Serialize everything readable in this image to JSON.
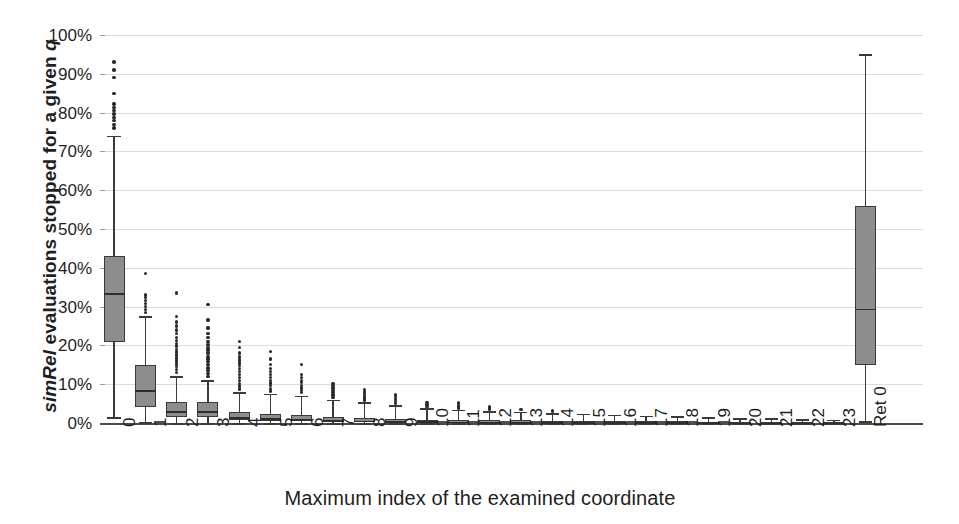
{
  "chart_data": {
    "type": "boxplot",
    "title": "",
    "xlabel": "Maximum index of the examined coordinate",
    "ylabel": "simRel evaluations stopped for a given q",
    "ylabel_parts": {
      "italic_prefix": "simRel",
      "rest": " evaluations stopped for a given ",
      "italic_suffix": "q"
    },
    "ylim": [
      0,
      100
    ],
    "yticks": [
      "0%",
      "10%",
      "20%",
      "30%",
      "40%",
      "50%",
      "60%",
      "70%",
      "80%",
      "90%",
      "100%"
    ],
    "ytick_values": [
      0,
      10,
      20,
      30,
      40,
      50,
      60,
      70,
      80,
      90,
      100
    ],
    "grid": true,
    "grid_color": "#dcdcdc",
    "legend": null,
    "box_fill": "#8d8d8d",
    "box_edge": "#3a3a3a",
    "categories": [
      "0",
      "1",
      "2",
      "3",
      "4",
      "5",
      "6",
      "7",
      "8",
      "9",
      "10",
      "11",
      "12",
      "13",
      "14",
      "15",
      "16",
      "17",
      "18",
      "19",
      "20",
      "21",
      "22",
      "23",
      "Ret 0"
    ],
    "boxes": [
      {
        "label": "0",
        "q1": 21.0,
        "median": 33.5,
        "q3": 43.0,
        "whisker_low": 1.5,
        "whisker_high": 74.0,
        "outliers": [
          76.0,
          77.0,
          78.0,
          78.8,
          79.6,
          80.5,
          81.3,
          82.2,
          85.0,
          89.0,
          91.0,
          93.0
        ]
      },
      {
        "label": "1",
        "q1": 4.0,
        "median": 8.5,
        "q3": 15.0,
        "whisker_low": 0.2,
        "whisker_high": 27.5,
        "outliers": [
          28.5,
          29.2,
          30.0,
          30.8,
          31.5,
          32.3,
          33.0,
          38.5
        ]
      },
      {
        "label": "2",
        "q1": 1.5,
        "median": 3.0,
        "q3": 5.5,
        "whisker_low": 0.0,
        "whisker_high": 12.0,
        "outliers": [
          13.0,
          13.8,
          14.5,
          15.2,
          16.0,
          16.8,
          17.5,
          18.3,
          19.0,
          19.8,
          20.5,
          21.3,
          22.0,
          23.0,
          24.0,
          25.0,
          26.0,
          27.5,
          33.5
        ]
      },
      {
        "label": "3",
        "q1": 1.5,
        "median": 3.0,
        "q3": 5.5,
        "whisker_low": 0.0,
        "whisker_high": 11.0,
        "outliers": [
          12.0,
          12.8,
          13.5,
          14.2,
          15.0,
          15.8,
          16.5,
          17.2,
          18.0,
          18.8,
          19.5,
          20.3,
          21.0,
          22.0,
          23.0,
          24.5,
          26.5,
          30.5
        ]
      },
      {
        "label": "4",
        "q1": 0.7,
        "median": 1.5,
        "q3": 2.8,
        "whisker_low": 0.0,
        "whisker_high": 8.0,
        "outliers": [
          8.8,
          9.5,
          10.2,
          11.0,
          11.8,
          12.5,
          13.2,
          14.0,
          14.8,
          15.5,
          16.2,
          17.0,
          18.0,
          19.5,
          21.0
        ]
      },
      {
        "label": "5",
        "q1": 0.5,
        "median": 1.2,
        "q3": 2.3,
        "whisker_low": 0.0,
        "whisker_high": 7.5,
        "outliers": [
          8.2,
          8.9,
          9.6,
          10.3,
          11.0,
          11.8,
          12.5,
          13.2,
          14.0,
          15.0,
          16.5,
          18.5
        ]
      },
      {
        "label": "6",
        "q1": 0.4,
        "median": 1.0,
        "q3": 2.0,
        "whisker_low": 0.0,
        "whisker_high": 7.0,
        "outliers": [
          7.8,
          8.4,
          9.0,
          9.7,
          10.4,
          11.0,
          11.8,
          12.5,
          15.0
        ]
      },
      {
        "label": "7",
        "q1": 0.3,
        "median": 0.8,
        "q3": 1.6,
        "whisker_low": 0.0,
        "whisker_high": 6.0,
        "outliers": [
          6.6,
          7.2,
          7.8,
          8.4,
          9.0,
          9.6,
          10.2
        ]
      },
      {
        "label": "8",
        "q1": 0.25,
        "median": 0.6,
        "q3": 1.3,
        "whisker_low": 0.0,
        "whisker_high": 5.3,
        "outliers": [
          5.9,
          6.4,
          6.9,
          7.4,
          8.0,
          8.6
        ]
      },
      {
        "label": "9",
        "q1": 0.2,
        "median": 0.5,
        "q3": 1.1,
        "whisker_low": 0.0,
        "whisker_high": 4.6,
        "outliers": [
          5.1,
          5.6,
          6.1,
          6.6,
          7.2
        ]
      },
      {
        "label": "10",
        "q1": 0.15,
        "median": 0.4,
        "q3": 0.9,
        "whisker_low": 0.0,
        "whisker_high": 3.8,
        "outliers": [
          4.3,
          4.8,
          5.3
        ]
      },
      {
        "label": "11",
        "q1": 0.12,
        "median": 0.35,
        "q3": 0.8,
        "whisker_low": 0.0,
        "whisker_high": 3.4,
        "outliers": [
          3.9,
          4.4,
          5.2
        ]
      },
      {
        "label": "12",
        "q1": 0.1,
        "median": 0.3,
        "q3": 0.7,
        "whisker_low": 0.0,
        "whisker_high": 3.1,
        "outliers": [
          3.6,
          4.1
        ]
      },
      {
        "label": "13",
        "q1": 0.1,
        "median": 0.28,
        "q3": 0.65,
        "whisker_low": 0.0,
        "whisker_high": 2.9,
        "outliers": [
          3.4
        ]
      },
      {
        "label": "14",
        "q1": 0.08,
        "median": 0.25,
        "q3": 0.6,
        "whisker_low": 0.0,
        "whisker_high": 2.6,
        "outliers": [
          3.1
        ]
      },
      {
        "label": "15",
        "q1": 0.08,
        "median": 0.22,
        "q3": 0.55,
        "whisker_low": 0.0,
        "whisker_high": 2.4,
        "outliers": []
      },
      {
        "label": "16",
        "q1": 0.06,
        "median": 0.2,
        "q3": 0.5,
        "whisker_low": 0.0,
        "whisker_high": 2.1,
        "outliers": []
      },
      {
        "label": "17",
        "q1": 0.05,
        "median": 0.18,
        "q3": 0.45,
        "whisker_low": 0.0,
        "whisker_high": 1.9,
        "outliers": []
      },
      {
        "label": "18",
        "q1": 0.05,
        "median": 0.16,
        "q3": 0.4,
        "whisker_low": 0.0,
        "whisker_high": 1.7,
        "outliers": []
      },
      {
        "label": "19",
        "q1": 0.04,
        "median": 0.14,
        "q3": 0.36,
        "whisker_low": 0.0,
        "whisker_high": 1.5,
        "outliers": []
      },
      {
        "label": "20",
        "q1": 0.04,
        "median": 0.12,
        "q3": 0.32,
        "whisker_low": 0.0,
        "whisker_high": 1.3,
        "outliers": []
      },
      {
        "label": "21",
        "q1": 0.03,
        "median": 0.1,
        "q3": 0.28,
        "whisker_low": 0.0,
        "whisker_high": 1.2,
        "outliers": []
      },
      {
        "label": "22",
        "q1": 0.03,
        "median": 0.09,
        "q3": 0.25,
        "whisker_low": 0.0,
        "whisker_high": 1.0,
        "outliers": []
      },
      {
        "label": "23",
        "q1": 0.02,
        "median": 0.08,
        "q3": 0.22,
        "whisker_low": 0.0,
        "whisker_high": 0.9,
        "outliers": []
      },
      {
        "label": "Ret 0",
        "q1": 15.0,
        "median": 29.5,
        "q3": 56.0,
        "whisker_low": 0.5,
        "whisker_high": 95.0,
        "outliers": []
      }
    ]
  }
}
